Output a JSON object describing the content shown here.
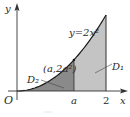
{
  "figure": {
    "curve_label": "y=2x²",
    "point_label": "(a,2a²)",
    "region_labels": {
      "d1": "D₁",
      "d2": "D₂"
    },
    "axis_labels": {
      "origin": "O",
      "x": "x",
      "y": "y"
    },
    "tick_labels": {
      "a": "a",
      "two": "2"
    },
    "colors": {
      "d1_fill": "#c4c4c4",
      "d2_fill": "#8a8a8a",
      "axis": "#333333",
      "curve": "#1a1a1a"
    }
  },
  "math": {
    "function": "y = 2x^2",
    "x_range": [
      0,
      2
    ],
    "a_value_relative": 0.5
  }
}
